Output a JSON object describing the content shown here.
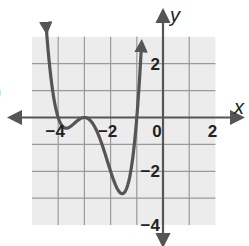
{
  "problem_label_fragment": ")",
  "chart_data": {
    "type": "line",
    "title": "",
    "xlabel": "x",
    "ylabel": "y",
    "xlim": [
      -5,
      2
    ],
    "ylim": [
      -4,
      3
    ],
    "grid": true,
    "grid_step": 1,
    "x_tick_labels": [
      {
        "value": -4,
        "label": "−4"
      },
      {
        "value": -2,
        "label": "−2"
      },
      {
        "value": 0,
        "label": "0"
      },
      {
        "value": 2,
        "label": "2"
      }
    ],
    "y_tick_labels": [
      {
        "value": 2,
        "label": "2"
      },
      {
        "value": -2,
        "label": "−2"
      },
      {
        "value": -4,
        "label": "−4"
      }
    ],
    "function": "f(x) = (x+4)(x+3)^2(x+1)",
    "roots": [
      -4,
      -3,
      -1
    ],
    "key_points": [
      {
        "x": -4,
        "y": 0,
        "note": "root (crosses)"
      },
      {
        "x": -3.7,
        "y": -0.4,
        "note": "local min"
      },
      {
        "x": -3,
        "y": 0,
        "note": "double root (touches)"
      },
      {
        "x": -1.5,
        "y": -2.8,
        "note": "local min"
      },
      {
        "x": -1,
        "y": 0,
        "note": "root (crosses)"
      }
    ],
    "domain_drawn": [
      -4.45,
      -0.82
    ],
    "end_behavior": "both ends arrow upward",
    "legend": null
  },
  "colors": {
    "grid_bg": "#ececec",
    "grid_line": "#9a9a9a",
    "axis": "#555555",
    "curve": "#555555",
    "text": "#222222"
  }
}
